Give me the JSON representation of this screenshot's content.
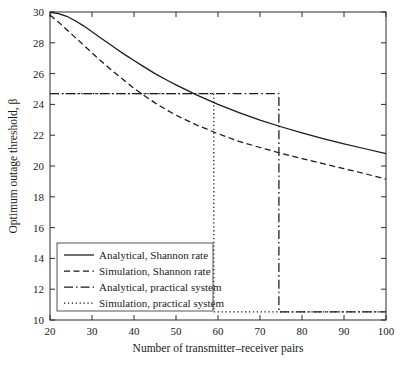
{
  "chart_data": {
    "type": "line",
    "title": "",
    "xlabel": "Number of transmitter–receiver pairs",
    "ylabel": "Optimum outage threshold, β",
    "xlim": [
      20,
      100
    ],
    "ylim": [
      10,
      30
    ],
    "xticks": [
      20,
      30,
      40,
      50,
      60,
      70,
      80,
      90,
      100
    ],
    "yticks": [
      10,
      12,
      14,
      16,
      18,
      20,
      22,
      24,
      26,
      28,
      30
    ],
    "xtick_labels": [
      "20",
      "30",
      "40",
      "50",
      "60",
      "70",
      "80",
      "90",
      "100"
    ],
    "ytick_labels": [
      "10",
      "12",
      "14",
      "16",
      "18",
      "20",
      "22",
      "24",
      "26",
      "28",
      "30"
    ],
    "grid": false,
    "legend_position": "lower left",
    "line_color": "#1a1a1a",
    "series": [
      {
        "name": "Analytical, Shannon rate",
        "style": "solid",
        "x": [
          20,
          22,
          24,
          26,
          28,
          30,
          32,
          34,
          36,
          38,
          40,
          42,
          45,
          48,
          50,
          55,
          60,
          65,
          70,
          75,
          80,
          85,
          90,
          95,
          100
        ],
        "values": [
          29.97,
          29.9,
          29.72,
          29.43,
          29.1,
          28.72,
          28.33,
          27.95,
          27.57,
          27.2,
          26.85,
          26.5,
          26.0,
          25.55,
          25.27,
          24.6,
          24.0,
          23.47,
          22.98,
          22.55,
          22.15,
          21.78,
          21.44,
          21.12,
          20.8
        ]
      },
      {
        "name": "Simulation, Shannon rate",
        "style": "dashed",
        "x": [
          20,
          22,
          24,
          26,
          28,
          30,
          32,
          34,
          36,
          38,
          40,
          42,
          45,
          48,
          50,
          55,
          60,
          65,
          70,
          75,
          80,
          85,
          90,
          95,
          100
        ],
        "values": [
          29.8,
          29.35,
          28.85,
          28.35,
          27.85,
          27.35,
          26.85,
          26.38,
          25.92,
          25.48,
          25.05,
          24.65,
          24.1,
          23.6,
          23.3,
          22.65,
          22.1,
          21.6,
          21.2,
          20.82,
          20.48,
          20.15,
          19.83,
          19.5,
          19.15
        ]
      },
      {
        "name": "Analytical, practical system",
        "style": "dashdot",
        "x": [
          20,
          74.5,
          74.5,
          100
        ],
        "values": [
          24.7,
          24.7,
          10.52,
          10.52
        ],
        "step_drop_x": 74.5,
        "upper_level": 24.7,
        "lower_level": 10.52
      },
      {
        "name": "Simulation, practical system",
        "style": "dotted",
        "x": [
          20,
          59,
          59,
          100
        ],
        "values": [
          24.7,
          24.7,
          10.52,
          10.52
        ],
        "step_drop_x": 59,
        "upper_level": 24.7,
        "lower_level": 10.52
      }
    ],
    "legend": [
      {
        "label": "Analytical, Shannon rate",
        "style": "solid"
      },
      {
        "label": "Simulation, Shannon rate",
        "style": "dashed"
      },
      {
        "label": "Analytical, practical system",
        "style": "dashdot"
      },
      {
        "label": "Simulation, practical system",
        "style": "dotted"
      }
    ]
  }
}
